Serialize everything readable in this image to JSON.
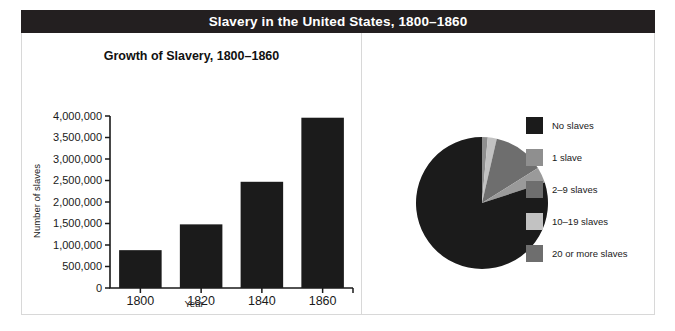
{
  "figure": {
    "title": "Slavery in the United States, 1800–1860",
    "title_bar_color": "#231f20",
    "title_text_color": "#ffffff",
    "border_color": "#d8d8d8",
    "background": "#ffffff"
  },
  "chart_data": [
    {
      "type": "bar",
      "title": "Growth of Slavery, 1800–1860",
      "xlabel": "Year",
      "ylabel": "Number of slaves",
      "categories": [
        "1800",
        "1820",
        "1840",
        "1860"
      ],
      "values": [
        880000,
        1480000,
        2470000,
        3960000
      ],
      "ylim": [
        0,
        4000000
      ],
      "ytick_values": [
        0,
        500000,
        1000000,
        1500000,
        2000000,
        2500000,
        3000000,
        3500000,
        4000000
      ],
      "ytick_labels": [
        "0",
        "500,000",
        "1,000,000",
        "1,500,000",
        "2,000,000",
        "2,500,000",
        "3,000,000",
        "3,500,000",
        "4,000,000"
      ],
      "bar_color": "#1b1b1b",
      "grid": false,
      "legend": "none"
    },
    {
      "type": "pie",
      "title": "Southerners Holding Slaves, 1860",
      "legend_position": "right",
      "start_angle_deg": 0,
      "direction": "clockwise",
      "slices": [
        {
          "label": "1 slave",
          "percent": 1.4,
          "color": "#8f8f8f"
        },
        {
          "label": "10–19 slaves",
          "percent": 2.2,
          "color": "#c2c2c2"
        },
        {
          "label": "2–9 slaves",
          "percent": 12.5,
          "color": "#6e6e6e"
        },
        {
          "label": "20 or more slaves",
          "percent": 3.9,
          "color": "#9a9a9a"
        },
        {
          "label": "No slaves",
          "percent": 80.0,
          "color": "#1b1b1b"
        }
      ],
      "legend_entries": [
        {
          "label": "No slaves",
          "color": "#1b1b1b"
        },
        {
          "label": "1 slave",
          "color": "#8f8f8f"
        },
        {
          "label": "2–9 slaves",
          "color": "#6e6e6e"
        },
        {
          "label": "10–19 slaves",
          "color": "#c2c2c2"
        },
        {
          "label": "20 or more slaves",
          "color": "#6e6e6e"
        }
      ]
    }
  ]
}
